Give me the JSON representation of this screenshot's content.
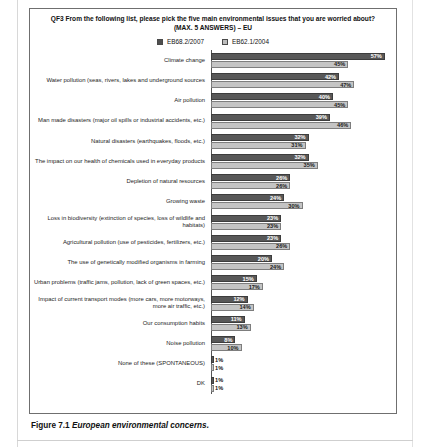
{
  "figure": {
    "number": "Figure 7.1",
    "caption": "European environmental concerns."
  },
  "chart": {
    "title": "QF3 From the following list, please pick the five main environmental issues that you are worried about? (MAX. 5 ANSWERS) – EU",
    "legend": [
      {
        "label": "EB68.2/2007",
        "color": "#585858"
      },
      {
        "label": "EB62.1/2004",
        "color": "#c4c4c4"
      }
    ]
  },
  "chart_data": {
    "type": "bar",
    "orientation": "horizontal",
    "title": "QF3 From the following list, please pick the five main environmental issues that you are worried about? (MAX. 5 ANSWERS) – EU",
    "xlabel": "",
    "ylabel": "",
    "xlim": [
      0,
      60
    ],
    "grid": false,
    "legend_position": "top-center",
    "value_suffix": "%",
    "categories": [
      "Climate change",
      "Water pollution (seas, rivers, lakes and underground sources",
      "Air pollution",
      "Man made disasters (major oil spills or industrial accidents, etc.)",
      "Natural disasters (earthquakes, floods, etc.)",
      "The impact on our health of chemicals used in everyday products",
      "Depletion of natural resources",
      "Growing waste",
      "Loss in biodiversity (extinction of species, loss of wildlife and habitats)",
      "Agricultural pollution (use of pesticides, fertilizers, etc.)",
      "The use of genetically modified organisms in farming",
      "Urban problems (traffic jams, pollution, lack of green spaces, etc.)",
      "Impact of current transport modes (more cars, more motorways, more air traffic, etc.)",
      "Our consumption habits",
      "Noise pollution",
      "None of these (SPONTANEOUS)",
      "DK"
    ],
    "series": [
      {
        "name": "EB68.2/2007",
        "color": "#585858",
        "values": [
          57,
          42,
          40,
          39,
          32,
          32,
          26,
          24,
          23,
          23,
          20,
          15,
          12,
          11,
          8,
          1,
          1
        ],
        "labels": [
          "57%",
          "42%",
          "40%",
          "39%",
          "32%",
          "32%",
          "26%",
          "24%",
          "23%",
          "23%",
          "20%",
          "15%",
          "12%",
          "11%",
          "8%",
          "1%",
          "1%"
        ]
      },
      {
        "name": "EB62.1/2004",
        "color": "#c4c4c4",
        "values": [
          45,
          47,
          45,
          46,
          31,
          35,
          26,
          30,
          23,
          26,
          24,
          17,
          14,
          13,
          10,
          1,
          1
        ],
        "labels": [
          "45%",
          "47%",
          "45%",
          "46%",
          "31%",
          "35%",
          "26%",
          "30%",
          "23%",
          "26%",
          "24%",
          "17%",
          "14%",
          "13%",
          "10%",
          "1%",
          "1%"
        ]
      }
    ]
  }
}
